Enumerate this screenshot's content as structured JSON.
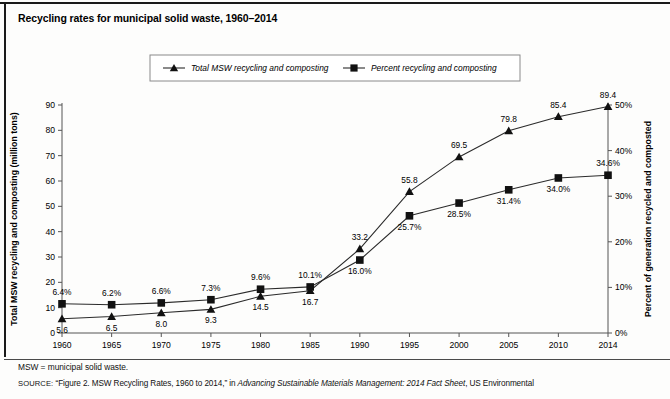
{
  "figure": {
    "title": "Recycling rates for municipal solid waste, 1960–2014",
    "abbreviation_note": "MSW = municipal solid waste.",
    "source_label": "SOURCE:",
    "source_text_1": "“Figure 2. MSW Recycling Rates, 1960 to 2014,” in ",
    "source_italic": "Advancing Sustainable Materials Management: 2014 Fact Sheet",
    "source_text_2": ", US Environmental"
  },
  "chart_data": {
    "type": "line",
    "title": "Recycling rates for municipal solid waste, 1960–2014",
    "xlabel": "",
    "ylabel": "Total MSW recycling and composting (million tons)",
    "y2label": "Percent of generation recycled and composted",
    "grid": false,
    "legend_position": "top-center",
    "categories": [
      "1960",
      "1965",
      "1970",
      "1975",
      "1980",
      "1985",
      "1990",
      "1995",
      "2000",
      "2005",
      "2010",
      "2014"
    ],
    "x_tick_labels": [
      "1960",
      "1965",
      "1970",
      "1975",
      "1980",
      "1985",
      "1990",
      "1995",
      "2000",
      "2005",
      "2010",
      "2014"
    ],
    "ylim": [
      0,
      90
    ],
    "y_ticks": [
      0,
      10,
      20,
      30,
      40,
      50,
      60,
      70,
      80,
      90
    ],
    "y_tick_labels": [
      "0",
      "10",
      "20",
      "30",
      "40",
      "50",
      "60",
      "70",
      "80",
      "90"
    ],
    "y2lim": [
      0,
      50
    ],
    "y2_ticks": [
      0,
      10,
      20,
      30,
      40,
      50
    ],
    "y2_tick_labels": [
      "0%",
      "10%",
      "20%",
      "30%",
      "40%",
      "50%"
    ],
    "series": [
      {
        "name": "Total MSW recycling and composting",
        "marker": "triangle",
        "axis": "left",
        "units": "million tons",
        "values": [
          5.6,
          6.5,
          8.0,
          9.3,
          14.5,
          16.7,
          33.2,
          55.8,
          69.5,
          79.8,
          85.4,
          89.4
        ],
        "point_labels": [
          "5.6",
          "6.5",
          "8.0",
          "9.3",
          "14.5",
          "16.7",
          "33.2",
          "55.8",
          "69.5",
          "79.8",
          "85.4",
          "89.4"
        ],
        "label_positions": [
          "below",
          "below",
          "below",
          "below",
          "below",
          "below",
          "above",
          "above",
          "above",
          "above",
          "above",
          "above"
        ]
      },
      {
        "name": "Percent recycling and composting",
        "marker": "square",
        "axis": "right",
        "units": "percent",
        "values": [
          6.4,
          6.2,
          6.6,
          7.3,
          9.6,
          10.1,
          16.0,
          25.7,
          28.5,
          31.4,
          34.0,
          34.6
        ],
        "point_labels": [
          "6.4%",
          "6.2%",
          "6.6%",
          "7.3%",
          "9.6%",
          "10.1%",
          "16.0%",
          "25.7%",
          "28.5%",
          "31.4%",
          "34.0%",
          "34.6%"
        ],
        "label_positions": [
          "above",
          "above",
          "above",
          "above",
          "above",
          "above",
          "below",
          "below",
          "below",
          "below",
          "below",
          "above"
        ]
      }
    ]
  },
  "legend": {
    "entries": [
      {
        "label": "Total MSW recycling and composting",
        "marker": "triangle"
      },
      {
        "label": "Percent recycling and composting",
        "marker": "square"
      }
    ]
  },
  "colors": {
    "line": "#2b2b2b",
    "text": "#000000",
    "axis": "#555555",
    "background": "#fdfdfc"
  }
}
